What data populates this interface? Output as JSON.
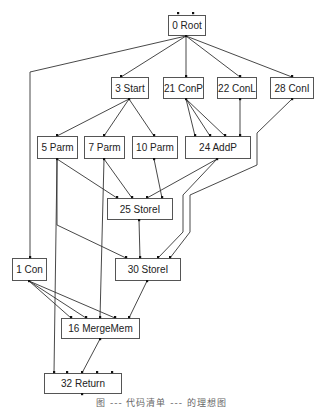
{
  "diagram": {
    "type": "ideal-graph",
    "nodes": [
      {
        "id": "n0",
        "label": "0 Root",
        "x": 168,
        "y": 15,
        "w": 37,
        "h": 20
      },
      {
        "id": "n3",
        "label": "3 Start",
        "x": 111,
        "y": 77,
        "w": 37,
        "h": 21
      },
      {
        "id": "n21",
        "label": "21 ConP",
        "x": 163,
        "y": 77,
        "w": 40,
        "h": 21
      },
      {
        "id": "n22",
        "label": "22 ConL",
        "x": 217,
        "y": 77,
        "w": 39,
        "h": 21
      },
      {
        "id": "n28",
        "label": "28 ConI",
        "x": 270,
        "y": 77,
        "w": 43,
        "h": 21
      },
      {
        "id": "n5",
        "label": "5 Parm",
        "x": 37,
        "y": 136,
        "w": 40,
        "h": 22
      },
      {
        "id": "n7",
        "label": "7 Parm",
        "x": 84,
        "y": 136,
        "w": 40,
        "h": 22
      },
      {
        "id": "n10",
        "label": "10 Parm",
        "x": 132,
        "y": 136,
        "w": 45,
        "h": 22
      },
      {
        "id": "n24",
        "label": "24 AddP",
        "x": 185,
        "y": 136,
        "w": 65,
        "h": 22
      },
      {
        "id": "n25",
        "label": "25 StoreI",
        "x": 107,
        "y": 198,
        "w": 65,
        "h": 21
      },
      {
        "id": "n1",
        "label": "1 Con",
        "x": 12,
        "y": 258,
        "w": 34,
        "h": 22
      },
      {
        "id": "n30",
        "label": "30 StoreI",
        "x": 115,
        "y": 258,
        "w": 65,
        "h": 22
      },
      {
        "id": "n16",
        "label": "16 MergeMem",
        "x": 61,
        "y": 318,
        "w": 78,
        "h": 20
      },
      {
        "id": "n32",
        "label": "32 Return",
        "x": 44,
        "y": 373,
        "w": 77,
        "h": 20
      }
    ],
    "edges": [
      {
        "from": "0 Root",
        "to": "1 Con",
        "points": [
          [
            186,
            36
          ],
          [
            30,
            72
          ],
          [
            30,
            258
          ]
        ]
      },
      {
        "from": "0 Root",
        "to": "3 Start",
        "points": [
          [
            186,
            36
          ],
          [
            121,
            77
          ]
        ]
      },
      {
        "from": "0 Root",
        "to": "21 ConP",
        "points": [
          [
            186,
            36
          ],
          [
            186,
            77
          ]
        ]
      },
      {
        "from": "0 Root",
        "to": "22 ConL",
        "points": [
          [
            186,
            36
          ],
          [
            240,
            77
          ]
        ]
      },
      {
        "from": "0 Root",
        "to": "28 ConI",
        "points": [
          [
            186,
            36
          ],
          [
            292,
            77
          ]
        ]
      },
      {
        "from": "3 Start",
        "to": "5 Parm",
        "points": [
          [
            129,
            99
          ],
          [
            57,
            136
          ]
        ]
      },
      {
        "from": "3 Start",
        "to": "7 Parm",
        "points": [
          [
            129,
            99
          ],
          [
            104,
            136
          ]
        ]
      },
      {
        "from": "3 Start",
        "to": "10 Parm",
        "points": [
          [
            129,
            99
          ],
          [
            154,
            136
          ]
        ]
      },
      {
        "from": "21 ConP",
        "to": "24 AddP",
        "points": [
          [
            186,
            99
          ],
          [
            195,
            136
          ]
        ]
      },
      {
        "from": "21 ConP",
        "to": "24 AddP",
        "points": [
          [
            186,
            99
          ],
          [
            210,
            136
          ]
        ]
      },
      {
        "from": "21 ConP",
        "to": "24 AddP",
        "points": [
          [
            186,
            99
          ],
          [
            225,
            136
          ]
        ]
      },
      {
        "from": "22 ConL",
        "to": "24 AddP",
        "points": [
          [
            240,
            99
          ],
          [
            240,
            136
          ]
        ]
      },
      {
        "from": "28 ConI",
        "to": "30 StoreI",
        "points": [
          [
            292,
            99
          ],
          [
            257,
            133
          ],
          [
            257,
            165
          ],
          [
            190,
            195
          ],
          [
            190,
            232
          ],
          [
            170,
            258
          ]
        ]
      },
      {
        "from": "5 Parm",
        "to": "25 StoreI",
        "points": [
          [
            57,
            159
          ],
          [
            117,
            198
          ]
        ]
      },
      {
        "from": "7 Parm",
        "to": "25 StoreI",
        "points": [
          [
            104,
            159
          ],
          [
            132,
            198
          ]
        ]
      },
      {
        "from": "10 Parm",
        "to": "25 StoreI",
        "points": [
          [
            154,
            159
          ],
          [
            162,
            198
          ]
        ]
      },
      {
        "from": "24 AddP",
        "to": "25 StoreI",
        "points": [
          [
            217,
            159
          ],
          [
            147,
            198
          ]
        ]
      },
      {
        "from": "24 AddP",
        "to": "30 StoreI",
        "points": [
          [
            217,
            159
          ],
          [
            183,
            195
          ],
          [
            183,
            232
          ],
          [
            158,
            258
          ]
        ]
      },
      {
        "from": "5 Parm",
        "to": "30 StoreI",
        "points": [
          [
            57,
            159
          ],
          [
            57,
            225
          ],
          [
            126,
            258
          ]
        ]
      },
      {
        "from": "5 Parm",
        "to": "32 Return",
        "points": [
          [
            57,
            159
          ],
          [
            54,
            373
          ]
        ]
      },
      {
        "from": "25 StoreI",
        "to": "30 StoreI",
        "points": [
          [
            139,
            220
          ],
          [
            140,
            258
          ]
        ]
      },
      {
        "from": "7 Parm",
        "to": "16 MergeMem",
        "points": [
          [
            104,
            159
          ],
          [
            100,
            318
          ]
        ]
      },
      {
        "from": "1 Con",
        "to": "16 MergeMem",
        "points": [
          [
            29,
            281
          ],
          [
            71,
            318
          ]
        ]
      },
      {
        "from": "1 Con",
        "to": "16 MergeMem",
        "points": [
          [
            29,
            281
          ],
          [
            86,
            318
          ]
        ]
      },
      {
        "from": "1 Con",
        "to": "16 MergeMem",
        "points": [
          [
            29,
            281
          ],
          [
            115,
            318
          ]
        ]
      },
      {
        "from": "30 StoreI",
        "to": "16 MergeMem",
        "points": [
          [
            147,
            281
          ],
          [
            129,
            318
          ]
        ]
      },
      {
        "from": "16 MergeMem",
        "to": "32 Return",
        "points": [
          [
            100,
            339
          ],
          [
            82,
            373
          ]
        ]
      }
    ],
    "ports": [
      [
        178,
        13
      ],
      [
        193,
        13
      ],
      [
        186,
        36
      ],
      [
        121,
        76
      ],
      [
        129,
        99
      ],
      [
        186,
        76
      ],
      [
        186,
        99
      ],
      [
        240,
        76
      ],
      [
        240,
        99
      ],
      [
        292,
        76
      ],
      [
        292,
        99
      ],
      [
        57,
        135
      ],
      [
        57,
        159
      ],
      [
        104,
        135
      ],
      [
        104,
        159
      ],
      [
        154,
        135
      ],
      [
        154,
        159
      ],
      [
        195,
        135
      ],
      [
        210,
        135
      ],
      [
        225,
        135
      ],
      [
        240,
        135
      ],
      [
        217,
        159
      ],
      [
        117,
        197
      ],
      [
        132,
        197
      ],
      [
        147,
        197
      ],
      [
        162,
        197
      ],
      [
        139,
        220
      ],
      [
        30,
        257
      ],
      [
        29,
        281
      ],
      [
        126,
        257
      ],
      [
        140,
        257
      ],
      [
        158,
        257
      ],
      [
        170,
        257
      ],
      [
        147,
        281
      ],
      [
        71,
        317
      ],
      [
        86,
        317
      ],
      [
        100,
        317
      ],
      [
        115,
        317
      ],
      [
        129,
        317
      ],
      [
        100,
        339
      ],
      [
        54,
        372
      ],
      [
        67,
        372
      ],
      [
        82,
        372
      ],
      [
        97,
        372
      ],
      [
        112,
        372
      ],
      [
        82,
        394
      ]
    ]
  },
  "caption": "图 ---  代码清单 --- 的理想图"
}
